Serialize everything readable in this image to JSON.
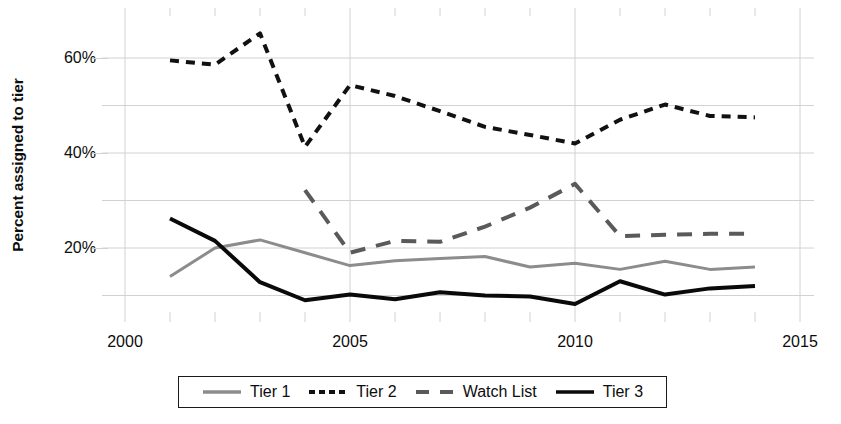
{
  "chart_data": {
    "type": "line",
    "title": "",
    "xlabel": "",
    "ylabel": "Percent assigned to tier",
    "xlim": [
      1999.0,
      2015.6
    ],
    "ylim": [
      5,
      68
    ],
    "xticks": [
      2000,
      2005,
      2010,
      2015
    ],
    "xtick_labels": [
      "2000",
      "2005",
      "2010",
      "2015"
    ],
    "x_minor_ticks": [
      2001,
      2002,
      2003,
      2004,
      2006,
      2007,
      2008,
      2009,
      2011,
      2012,
      2013,
      2014
    ],
    "yticks": [
      10,
      20,
      30,
      40,
      50,
      60
    ],
    "ytick_labels": [
      "",
      "20%",
      "",
      "40%",
      "",
      "60%"
    ],
    "grid": true,
    "legend_position": "bottom",
    "x": [
      2001,
      2002,
      2003,
      2004,
      2005,
      2006,
      2007,
      2008,
      2009,
      2010,
      2011,
      2012,
      2013,
      2014
    ],
    "series": [
      {
        "name": "Tier 1",
        "color": "#8c8c8c",
        "style": "solid",
        "width": 3,
        "x": [
          2001,
          2002,
          2003,
          2004,
          2005,
          2006,
          2007,
          2008,
          2009,
          2010,
          2011,
          2012,
          2013,
          2014
        ],
        "values": [
          14.0,
          20.0,
          21.7,
          19.0,
          16.3,
          17.3,
          17.8,
          18.2,
          16.0,
          16.8,
          15.5,
          17.2,
          15.5,
          16.0
        ]
      },
      {
        "name": "Tier 2",
        "color": "#111111",
        "style": "dashed",
        "width": 4,
        "x": [
          2001,
          2002,
          2003,
          2004,
          2005,
          2006,
          2007,
          2008,
          2009,
          2010,
          2011,
          2012,
          2013,
          2014
        ],
        "values": [
          59.5,
          58.6,
          65.2,
          41.3,
          54.3,
          52.0,
          48.8,
          45.5,
          43.8,
          42.0,
          47.0,
          50.2,
          47.8,
          47.5
        ]
      },
      {
        "name": "Watch List",
        "color": "#5a5a5a",
        "style": "longdash",
        "width": 4,
        "x": [
          2004,
          2005,
          2006,
          2007,
          2008,
          2009,
          2010,
          2011,
          2012,
          2013,
          2014
        ],
        "values": [
          32.2,
          19.0,
          21.5,
          21.3,
          24.5,
          28.5,
          33.5,
          22.5,
          22.8,
          23.0,
          23.0
        ]
      },
      {
        "name": "Tier 3",
        "color": "#0a0a0a",
        "style": "solid",
        "width": 4,
        "x": [
          2001,
          2002,
          2003,
          2004,
          2005,
          2006,
          2007,
          2008,
          2009,
          2010,
          2011,
          2012,
          2013,
          2014
        ],
        "values": [
          26.2,
          21.5,
          12.8,
          9.0,
          10.2,
          9.2,
          10.7,
          10.0,
          9.8,
          8.2,
          13.0,
          10.2,
          11.5,
          12.0
        ]
      }
    ]
  },
  "axis": {
    "y_title": "Percent assigned to tier",
    "y_ticks": [
      {
        "label": "60%",
        "value": 60
      },
      {
        "label": "40%",
        "value": 40
      },
      {
        "label": "20%",
        "value": 20
      }
    ],
    "x_ticks": [
      {
        "label": "2000",
        "value": 2000
      },
      {
        "label": "2005",
        "value": 2005
      },
      {
        "label": "2010",
        "value": 2010
      },
      {
        "label": "2015",
        "value": 2015
      }
    ]
  },
  "legend": {
    "items": [
      {
        "label": "Tier 1",
        "color": "#8c8c8c",
        "style": "solid"
      },
      {
        "label": "Tier 2",
        "color": "#111111",
        "style": "dashed"
      },
      {
        "label": "Watch List",
        "color": "#5a5a5a",
        "style": "longdash"
      },
      {
        "label": "Tier 3",
        "color": "#0a0a0a",
        "style": "solid"
      }
    ]
  },
  "colors": {
    "background": "#ffffff",
    "grid": "#d2d2d2",
    "text": "#0d0d0d",
    "legend_border": "#1a1a1a"
  }
}
